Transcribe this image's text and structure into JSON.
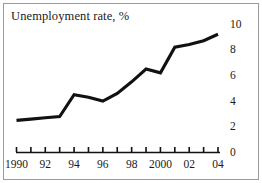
{
  "chart_data": {
    "type": "line",
    "title": "Unemployment rate, %",
    "xlabel": "",
    "ylabel": "",
    "x": [
      1990,
      1991,
      1992,
      1993,
      1994,
      1995,
      1996,
      1997,
      1998,
      1999,
      2000,
      2001,
      2002,
      2003,
      2004
    ],
    "values": [
      2.5,
      2.6,
      2.7,
      2.8,
      4.5,
      4.3,
      4.0,
      4.6,
      5.5,
      6.5,
      6.2,
      8.2,
      8.4,
      8.7,
      9.2
    ],
    "series": [
      {
        "name": "Unemployment rate",
        "values": [
          2.5,
          2.6,
          2.7,
          2.8,
          4.5,
          4.3,
          4.0,
          4.6,
          5.5,
          6.5,
          6.2,
          8.2,
          8.4,
          8.7,
          9.2
        ]
      }
    ],
    "xlim": [
      1990,
      2004
    ],
    "ylim": [
      0,
      10
    ],
    "grid": false,
    "legend": "none",
    "y_ticks": [
      0,
      2,
      4,
      6,
      8,
      10
    ],
    "y_tick_labels": [
      "0",
      "2",
      "4",
      "6",
      "8",
      "10"
    ],
    "y_axis_position": "right",
    "x_ticks": [
      1990,
      1991,
      1992,
      1993,
      1994,
      1995,
      1996,
      1997,
      1998,
      1999,
      2000,
      2001,
      2002,
      2003,
      2004
    ],
    "x_tick_labels": [
      {
        "x": 1990,
        "label": "1990"
      },
      {
        "x": 1992,
        "label": "92"
      },
      {
        "x": 1994,
        "label": "94"
      },
      {
        "x": 1996,
        "label": "96"
      },
      {
        "x": 1998,
        "label": "98"
      },
      {
        "x": 2000,
        "label": "2000"
      },
      {
        "x": 2002,
        "label": "02"
      },
      {
        "x": 2004,
        "label": "04"
      }
    ],
    "colors": {
      "line": "#111111",
      "axis": "#111111",
      "text": "#1a1a1a",
      "frame": "#9a9a9a",
      "background": "#ffffff"
    }
  }
}
